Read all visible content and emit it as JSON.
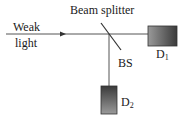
{
  "diagram": {
    "input_label_line1": "Weak",
    "input_label_line2": "light",
    "splitter_label": "Beam splitter",
    "bs_label": "BS",
    "detector1": {
      "name": "D",
      "sub": "1"
    },
    "detector2": {
      "name": "D",
      "sub": "2"
    },
    "colors": {
      "line": "#555555",
      "detector_dark": "#3a3a3a",
      "detector_light": "#9a9a9a"
    }
  }
}
